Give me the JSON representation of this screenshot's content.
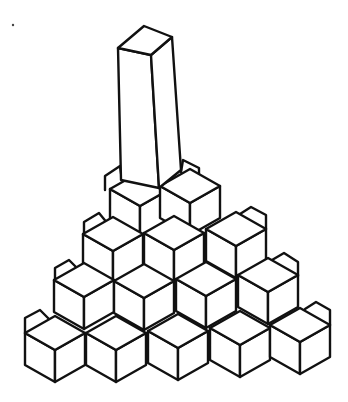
{
  "illustration": {
    "subject": "hand-drawn isometric pyramid of cubes with a tall rectangular column on top",
    "background": "#ffffff",
    "ink": "#111111",
    "width": 348,
    "height": 402,
    "speck": {
      "x": 13,
      "y": 25,
      "r": 1.2
    },
    "cube_geometry": {
      "half_width": 30,
      "rhombus_half_height": 17,
      "side_height": 32
    },
    "rows": [
      {
        "name": "row-1-bottom",
        "count": 5,
        "front_tops": [
          [
            55,
            350
          ],
          [
            116,
            350
          ],
          [
            178,
            348
          ],
          [
            240,
            345
          ],
          [
            300,
            342
          ]
        ]
      },
      {
        "name": "row-2",
        "count": 4,
        "front_tops": [
          [
            84,
            297
          ],
          [
            144,
            298
          ],
          [
            206,
            296
          ],
          [
            268,
            292
          ]
        ]
      },
      {
        "name": "row-3",
        "count": 3,
        "front_tops": [
          [
            113,
            251
          ],
          [
            174,
            250
          ],
          [
            236,
            246
          ]
        ]
      },
      {
        "name": "row-4-top",
        "count": 2,
        "front_tops": [
          [
            140,
            206
          ],
          [
            190,
            203
          ]
        ]
      }
    ],
    "back_cubes": [
      {
        "name": "back-left-row-1",
        "points": [
          [
            25,
            333
          ],
          [
            25,
            318
          ],
          [
            40,
            310
          ],
          [
            50,
            320
          ]
        ]
      },
      {
        "name": "back-left-row-2",
        "points": [
          [
            55,
            283
          ],
          [
            55,
            268
          ],
          [
            69,
            260
          ],
          [
            79,
            270
          ]
        ]
      },
      {
        "name": "back-left-row-3",
        "points": [
          [
            84,
            236
          ],
          [
            84,
            222
          ],
          [
            99,
            213
          ],
          [
            108,
            224
          ]
        ]
      },
      {
        "name": "back-left-row-4",
        "points": [
          [
            105,
            190
          ],
          [
            105,
            176
          ],
          [
            120,
            166
          ],
          [
            122,
            180
          ]
        ]
      },
      {
        "name": "back-right-row-1",
        "points": [
          [
            330,
            325
          ],
          [
            330,
            310
          ],
          [
            316,
            302
          ],
          [
            305,
            309
          ]
        ]
      },
      {
        "name": "back-right-row-2",
        "points": [
          [
            298,
            276
          ],
          [
            298,
            262
          ],
          [
            284,
            253
          ],
          [
            272,
            260
          ]
        ]
      },
      {
        "name": "back-right-row-3",
        "points": [
          [
            266,
            229
          ],
          [
            266,
            215
          ],
          [
            251,
            207
          ],
          [
            240,
            214
          ]
        ]
      },
      {
        "name": "back-right-row-4",
        "points": [
          [
            199,
            184
          ],
          [
            199,
            168
          ],
          [
            183,
            160
          ],
          [
            181,
            172
          ]
        ]
      }
    ],
    "column": {
      "top_face": [
        [
          144,
          26
        ],
        [
          172,
          37
        ],
        [
          151,
          55
        ],
        [
          118,
          48
        ]
      ],
      "left_face": [
        [
          118,
          48
        ],
        [
          151,
          55
        ],
        [
          159,
          188
        ],
        [
          121,
          180
        ]
      ],
      "right_face": [
        [
          151,
          55
        ],
        [
          172,
          37
        ],
        [
          181,
          170
        ],
        [
          159,
          188
        ]
      ]
    }
  }
}
